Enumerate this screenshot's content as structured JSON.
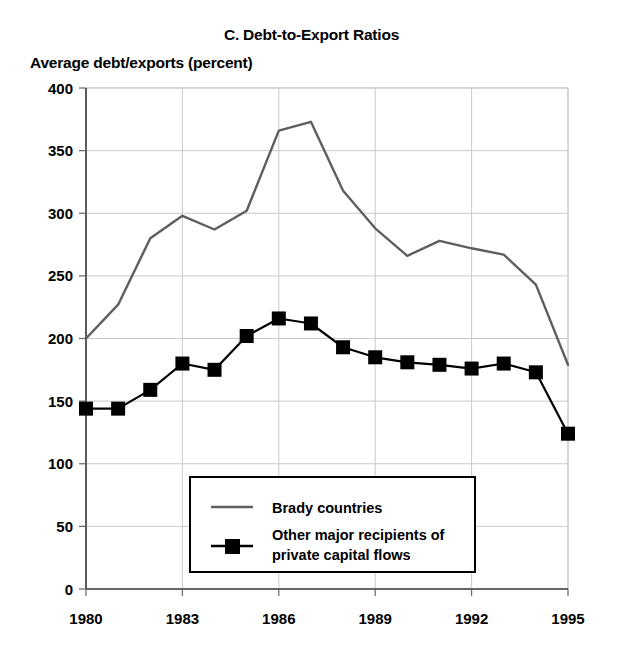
{
  "chart_data": {
    "type": "line",
    "title": "C. Debt-to-Export Ratios",
    "ylabel": "Average debt/exports (percent)",
    "xlabel": "",
    "grid": true,
    "legend_position": "inside-lower-center",
    "xlim": [
      1980,
      1995
    ],
    "ylim": [
      0,
      400
    ],
    "yticks": [
      0,
      50,
      100,
      150,
      200,
      250,
      300,
      350,
      400
    ],
    "ytick_labels": [
      "0",
      "50",
      "100",
      "150",
      "200",
      "250",
      "300",
      "350",
      "400"
    ],
    "xticks": [
      1980,
      1983,
      1986,
      1989,
      1992,
      1995
    ],
    "xtick_labels": [
      "1980",
      "1983",
      "1986",
      "1989",
      "1992",
      "1995"
    ],
    "x": [
      1980,
      1981,
      1982,
      1983,
      1984,
      1985,
      1986,
      1987,
      1988,
      1989,
      1990,
      1991,
      1992,
      1993,
      1994,
      1995
    ],
    "series": [
      {
        "name": "Brady countries",
        "color": "#5e5e5e",
        "marker": "none",
        "values": [
          200,
          227,
          280,
          298,
          287,
          302,
          366,
          373,
          318,
          288,
          266,
          278,
          272,
          267,
          243,
          179
        ]
      },
      {
        "name": "Other major recipients of private capital flows",
        "color": "#000000",
        "marker": "square",
        "values": [
          144,
          144,
          159,
          180,
          175,
          202,
          216,
          212,
          193,
          185,
          181,
          179,
          176,
          180,
          173,
          124
        ]
      }
    ]
  },
  "legend": {
    "entries": [
      {
        "label": "Brady countries",
        "line_color": "#5e5e5e",
        "marker": "none"
      },
      {
        "label": "Other major recipients of",
        "label2": "private capital flows",
        "line_color": "#000000",
        "marker": "square"
      }
    ]
  }
}
